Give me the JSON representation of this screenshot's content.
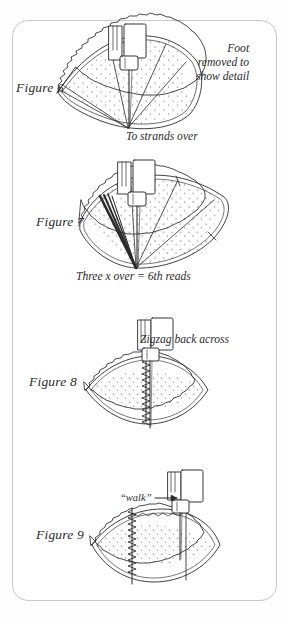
{
  "page": {
    "kind": "scanned-book-illustration-page",
    "background_color": "#ffffff",
    "frame_color": "#c8c8c8",
    "ink_color": "#2b2b2b"
  },
  "figures": [
    {
      "id": "figure-6",
      "label": "Figure 6",
      "notes": [
        {
          "id": "foot-removed",
          "text": "Foot\nremoved to\nshow detail"
        },
        {
          "id": "to-strands-over",
          "text": "To strands over"
        }
      ]
    },
    {
      "id": "figure-7",
      "label": "Figure 7",
      "notes": [
        {
          "id": "three-x-over",
          "text": "Three x over = 6th reads"
        }
      ]
    },
    {
      "id": "figure-8",
      "label": "Figure 8",
      "notes": [
        {
          "id": "zigzag-back-across",
          "text": "Zigzag back across"
        }
      ]
    },
    {
      "id": "figure-9",
      "label": "Figure 9",
      "notes": [
        {
          "id": "walk",
          "text": "“walk”"
        }
      ]
    }
  ],
  "captions": {
    "figure6_label": "Figure 6",
    "figure7_label": "Figure 7",
    "figure8_label": "Figure 8",
    "figure9_label": "Figure 9",
    "foot_line1": "Foot",
    "foot_line2": "removed to",
    "foot_line3": "show detail",
    "to_strands_over": "To strands over",
    "three_x_over": "Three x over = 6th reads",
    "zigzag_back_across": "Zigzag back across",
    "walk": "“walk”"
  }
}
